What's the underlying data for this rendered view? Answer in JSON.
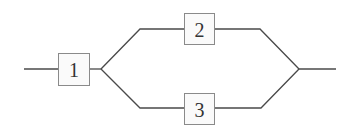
{
  "diagram": {
    "type": "reliability-block-diagram",
    "blocks": [
      {
        "id": "1",
        "label": "1"
      },
      {
        "id": "2",
        "label": "2"
      },
      {
        "id": "3",
        "label": "3"
      }
    ],
    "structure": "Block 1 in series with parallel combination of blocks 2 and 3",
    "colors": {
      "wire": "#4a4a4a",
      "block_border": "#8a8a8a",
      "block_fill": "#fafafa",
      "text": "#333333"
    }
  }
}
